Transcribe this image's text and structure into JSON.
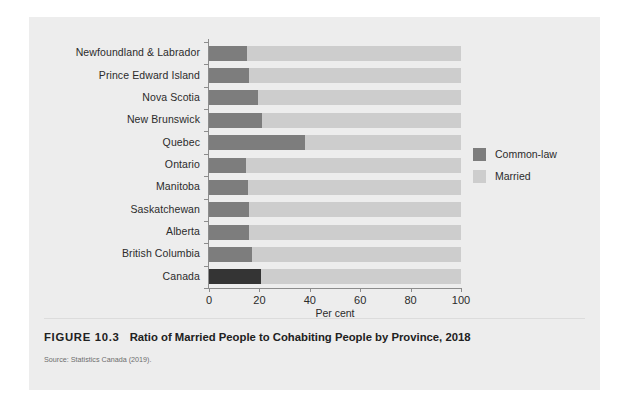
{
  "figure": {
    "number_label": "FIGURE 10.3",
    "title": "Ratio of Married People to Cohabiting People by Province, 2018",
    "source": "Source: Statistics Canada (2019)."
  },
  "legend": {
    "position": "right",
    "items": [
      {
        "label": "Common-law",
        "color": "#7d7d7d"
      },
      {
        "label": "Married",
        "color": "#cdcdcd"
      }
    ]
  },
  "colors": {
    "panel_background": "#ededed",
    "page_background": "#ffffff",
    "common_law": "#7d7d7d",
    "common_law_canada": "#343434",
    "married": "#cdcdcd",
    "axis": "#8c8c8c",
    "text": "#2b2b2b"
  },
  "chart_data": {
    "type": "bar",
    "orientation": "horizontal",
    "stacked": true,
    "title": "Ratio of Married People to Cohabiting People by Province, 2018",
    "xlabel": "Per cent",
    "ylabel": "",
    "xlim": [
      0,
      100
    ],
    "xticks": [
      0,
      20,
      40,
      60,
      80,
      100
    ],
    "grid": false,
    "legend_position": "right",
    "categories": [
      "Newfoundland & Labrador",
      "Prince Edward Island",
      "Nova Scotia",
      "New Brunswick",
      "Quebec",
      "Ontario",
      "Manitoba",
      "Saskatchewan",
      "Alberta",
      "British Columbia",
      "Canada"
    ],
    "series": [
      {
        "name": "Common-law",
        "values": [
          15,
          16,
          19.5,
          21,
          38,
          14.5,
          15.5,
          16,
          16,
          17,
          20.5
        ]
      },
      {
        "name": "Married",
        "values": [
          85,
          84,
          80.5,
          79,
          62,
          85.5,
          84.5,
          84,
          84,
          83,
          79.5
        ]
      }
    ]
  }
}
